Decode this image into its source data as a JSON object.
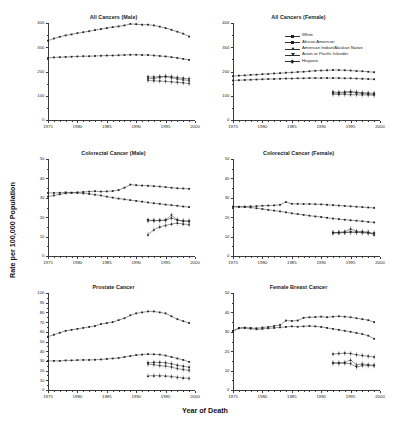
{
  "figure": {
    "xlabel": "Year of Death",
    "ylabel": "Rate per 100,000 Population",
    "x_ticks": [
      "1975",
      "1980",
      "1985",
      "1990",
      "1995",
      "2000"
    ],
    "x_range": [
      1975,
      2000
    ]
  },
  "legend": {
    "position": "top-right-of-panel-2",
    "entries": [
      {
        "label": "White",
        "marker": "square"
      },
      {
        "label": "African American",
        "marker": "square"
      },
      {
        "label": "American Indian/Alaskan Native",
        "marker": "triangle-up"
      },
      {
        "label": "Asian or Pacific Islander",
        "marker": "triangle-down"
      },
      {
        "label": "Hispanic",
        "marker": "diamond"
      }
    ]
  },
  "chart_data": [
    {
      "type": "line",
      "title": "All Cancers (Male)",
      "xlabel": "Year of Death",
      "ylabel": "Rate per 100,000 Population",
      "ylim": [
        0,
        400
      ],
      "y_ticks": [
        0,
        100,
        200,
        300,
        400
      ],
      "xlim": [
        1975,
        2000
      ],
      "x": [
        1975,
        1976,
        1977,
        1978,
        1979,
        1980,
        1981,
        1982,
        1983,
        1984,
        1985,
        1986,
        1987,
        1988,
        1989,
        1990,
        1991,
        1992,
        1993,
        1994,
        1995,
        1996,
        1997,
        1998,
        1999
      ],
      "series": [
        {
          "name": "African American",
          "marker": "square",
          "values": [
            327,
            336,
            343,
            349,
            353,
            358,
            362,
            366,
            371,
            375,
            379,
            383,
            386,
            390,
            396,
            395,
            393,
            393,
            390,
            385,
            379,
            372,
            364,
            356,
            344
          ]
        },
        {
          "name": "White",
          "marker": "square",
          "values": [
            256,
            258,
            259,
            260,
            261,
            262,
            263,
            263,
            264,
            265,
            266,
            266,
            267,
            268,
            269,
            269,
            268,
            268,
            266,
            264,
            262,
            259,
            256,
            252,
            248
          ]
        },
        {
          "name": "American Indian/Alaskan Native",
          "marker": "triangle-up",
          "x": [
            1992,
            1993,
            1994,
            1995,
            1996,
            1997,
            1998,
            1999
          ],
          "values": [
            172,
            171,
            176,
            179,
            175,
            170,
            166,
            163
          ]
        },
        {
          "name": "Asian or Pacific Islander",
          "marker": "triangle-down",
          "x": [
            1992,
            1993,
            1994,
            1995,
            1996,
            1997,
            1998,
            1999
          ],
          "values": [
            163,
            161,
            160,
            159,
            157,
            155,
            153,
            150
          ]
        },
        {
          "name": "Hispanic",
          "marker": "diamond",
          "x": [
            1992,
            1993,
            1994,
            1995,
            1996,
            1997,
            1998,
            1999
          ],
          "values": [
            178,
            177,
            179,
            180,
            178,
            175,
            172,
            170
          ]
        }
      ]
    },
    {
      "type": "line",
      "title": "All Cancers (Female)",
      "ylim": [
        0,
        400
      ],
      "y_ticks": [
        0,
        100,
        200,
        300,
        400
      ],
      "xlim": [
        1975,
        2000
      ],
      "x": [
        1975,
        1976,
        1977,
        1978,
        1979,
        1980,
        1981,
        1982,
        1983,
        1984,
        1985,
        1986,
        1987,
        1988,
        1989,
        1990,
        1991,
        1992,
        1993,
        1994,
        1995,
        1996,
        1997,
        1998,
        1999
      ],
      "series": [
        {
          "name": "African American",
          "marker": "square",
          "values": [
            181,
            183,
            184,
            186,
            187,
            189,
            190,
            192,
            193,
            195,
            196,
            198,
            199,
            201,
            203,
            204,
            205,
            206,
            206,
            205,
            204,
            202,
            201,
            199,
            197
          ]
        },
        {
          "name": "White",
          "marker": "square",
          "values": [
            163,
            164,
            165,
            166,
            167,
            168,
            169,
            169,
            170,
            171,
            171,
            172,
            172,
            173,
            173,
            173,
            173,
            173,
            173,
            172,
            172,
            171,
            170,
            169,
            168
          ]
        },
        {
          "name": "American Indian/Alaskan Native",
          "marker": "triangle-up",
          "x": [
            1992,
            1993,
            1994,
            1995,
            1996,
            1997,
            1998,
            1999
          ],
          "values": [
            112,
            110,
            113,
            117,
            113,
            110,
            108,
            106
          ]
        },
        {
          "name": "Asian or Pacific Islander",
          "marker": "triangle-down",
          "x": [
            1992,
            1993,
            1994,
            1995,
            1996,
            1997,
            1998,
            1999
          ],
          "values": [
            106,
            105,
            105,
            104,
            104,
            103,
            103,
            102
          ]
        },
        {
          "name": "Hispanic",
          "marker": "diamond",
          "x": [
            1992,
            1993,
            1994,
            1995,
            1996,
            1997,
            1998,
            1999
          ],
          "values": [
            115,
            114,
            115,
            116,
            114,
            112,
            111,
            110
          ]
        }
      ]
    },
    {
      "type": "line",
      "title": "Colorectal Cancer (Male)",
      "ylim": [
        0,
        50
      ],
      "y_ticks": [
        0,
        10,
        20,
        30,
        40,
        50
      ],
      "xlim": [
        1975,
        2000
      ],
      "x": [
        1975,
        1976,
        1977,
        1978,
        1979,
        1980,
        1981,
        1982,
        1983,
        1984,
        1985,
        1986,
        1987,
        1988,
        1989,
        1990,
        1991,
        1992,
        1993,
        1994,
        1995,
        1996,
        1997,
        1998,
        1999
      ],
      "series": [
        {
          "name": "African American",
          "marker": "square",
          "values": [
            32.5,
            32.5,
            32.6,
            32.8,
            32.6,
            32.8,
            33.0,
            33.2,
            33.4,
            33.2,
            33.3,
            33.5,
            34.0,
            35.2,
            36.8,
            36.5,
            36.3,
            36.2,
            36.0,
            35.8,
            35.5,
            35.2,
            34.9,
            34.8,
            34.6
          ]
        },
        {
          "name": "White",
          "marker": "square",
          "values": [
            30.6,
            31.2,
            31.8,
            32.3,
            32.6,
            32.5,
            32.3,
            32.0,
            31.6,
            31.2,
            30.6,
            30.1,
            29.6,
            29.2,
            28.8,
            28.4,
            28.0,
            27.6,
            27.2,
            26.9,
            26.5,
            26.2,
            25.9,
            25.5,
            25.2
          ]
        },
        {
          "name": "American Indian/Alaskan Native",
          "marker": "triangle-up",
          "x": [
            1992,
            1993,
            1994,
            1995,
            1996,
            1997,
            1998,
            1999
          ],
          "values": [
            11.0,
            13.5,
            15.0,
            15.8,
            16.5,
            17.0,
            16.5,
            16.2
          ]
        },
        {
          "name": "Asian or Pacific Islander",
          "marker": "triangle-down",
          "x": [
            1992,
            1993,
            1994,
            1995,
            1996,
            1997,
            1998,
            1999
          ],
          "values": [
            18.5,
            18.3,
            18.3,
            18.5,
            21.0,
            18.6,
            18.0,
            17.8
          ]
        },
        {
          "name": "Hispanic",
          "marker": "diamond",
          "x": [
            1992,
            1993,
            1994,
            1995,
            1996,
            1997,
            1998,
            1999
          ],
          "values": [
            18.2,
            18.2,
            18.3,
            18.4,
            19.5,
            18.4,
            18.1,
            18.0
          ]
        }
      ]
    },
    {
      "type": "line",
      "title": "Colorectal Cancer (Female)",
      "ylim": [
        0,
        50
      ],
      "y_ticks": [
        0,
        10,
        20,
        30,
        40,
        50
      ],
      "xlim": [
        1975,
        2000
      ],
      "x": [
        1975,
        1976,
        1977,
        1978,
        1979,
        1980,
        1981,
        1982,
        1983,
        1984,
        1985,
        1986,
        1987,
        1988,
        1989,
        1990,
        1991,
        1992,
        1993,
        1994,
        1995,
        1996,
        1997,
        1998,
        1999
      ],
      "series": [
        {
          "name": "African American",
          "marker": "square",
          "values": [
            25.4,
            25.4,
            25.5,
            25.6,
            25.7,
            25.9,
            26.0,
            26.1,
            26.4,
            27.8,
            26.9,
            26.9,
            26.8,
            26.8,
            26.7,
            26.6,
            26.4,
            26.2,
            26.0,
            25.8,
            25.6,
            25.4,
            25.2,
            25.0,
            24.8
          ]
        },
        {
          "name": "White",
          "marker": "square",
          "values": [
            25.4,
            25.3,
            25.2,
            25.0,
            24.6,
            24.2,
            23.8,
            23.4,
            23.0,
            22.5,
            22.0,
            21.6,
            21.2,
            20.8,
            20.4,
            20.1,
            19.7,
            19.3,
            19.0,
            18.7,
            18.4,
            18.2,
            17.9,
            17.6,
            17.3
          ]
        },
        {
          "name": "American Indian/Alaskan Native",
          "marker": "triangle-up",
          "x": [
            1992,
            1993,
            1994,
            1995,
            1996,
            1997,
            1998,
            1999
          ],
          "values": [
            12.0,
            12.2,
            12.5,
            14.0,
            12.8,
            12.6,
            12.3,
            10.9
          ]
        },
        {
          "name": "Asian or Pacific Islander",
          "marker": "triangle-down",
          "x": [
            1992,
            1993,
            1994,
            1995,
            1996,
            1997,
            1998,
            1999
          ],
          "values": [
            11.8,
            11.9,
            12.0,
            12.2,
            12.1,
            12.0,
            11.8,
            11.5
          ]
        },
        {
          "name": "Hispanic",
          "marker": "diamond",
          "x": [
            1992,
            1993,
            1994,
            1995,
            1996,
            1997,
            1998,
            1999
          ],
          "values": [
            12.1,
            12.1,
            12.2,
            12.4,
            12.3,
            12.2,
            12.0,
            11.8
          ]
        }
      ]
    },
    {
      "type": "line",
      "title": "Prostate Cancer",
      "ylim": [
        0,
        100
      ],
      "y_ticks": [
        0,
        10,
        20,
        30,
        40,
        50,
        60,
        70,
        80,
        90,
        100
      ],
      "xlim": [
        1975,
        2000
      ],
      "x": [
        1975,
        1976,
        1977,
        1978,
        1979,
        1980,
        1981,
        1982,
        1983,
        1984,
        1985,
        1986,
        1987,
        1988,
        1989,
        1990,
        1991,
        1992,
        1993,
        1994,
        1995,
        1996,
        1997,
        1998,
        1999
      ],
      "series": [
        {
          "name": "African American",
          "marker": "square",
          "values": [
            55,
            57,
            59,
            61,
            62,
            63,
            64,
            65,
            66,
            68,
            69,
            70,
            72,
            74,
            77,
            79,
            80,
            81,
            81,
            80,
            79,
            76,
            73,
            71,
            69
          ]
        },
        {
          "name": "White",
          "marker": "square",
          "values": [
            30,
            30,
            30,
            30.5,
            30.5,
            30.8,
            31,
            31,
            31.2,
            31.5,
            32,
            32.5,
            33,
            34,
            35,
            36,
            36.5,
            37,
            36.8,
            36.5,
            35.5,
            34,
            32.5,
            31,
            29
          ]
        },
        {
          "name": "American Indian/Alaskan Native",
          "marker": "triangle-up",
          "x": [
            1992,
            1993,
            1994,
            1995,
            1996,
            1997,
            1998,
            1999
          ],
          "values": [
            14.5,
            14.8,
            14.8,
            14.5,
            14.0,
            13.2,
            12.5,
            12.0
          ]
        },
        {
          "name": "Asian or Pacific Islander",
          "marker": "triangle-down",
          "x": [
            1992,
            1993,
            1994,
            1995,
            1996,
            1997,
            1998,
            1999
          ],
          "values": [
            26.5,
            26.0,
            25.0,
            24.5,
            23.5,
            22.0,
            21.0,
            20.0
          ]
        },
        {
          "name": "Hispanic",
          "marker": "diamond",
          "x": [
            1992,
            1993,
            1994,
            1995,
            1996,
            1997,
            1998,
            1999
          ],
          "values": [
            28.0,
            28.5,
            28.5,
            28.0,
            27.0,
            25.5,
            24.5,
            23.5
          ]
        }
      ]
    },
    {
      "type": "line",
      "title": "Female Breast Cancer",
      "ylim": [
        0,
        50
      ],
      "y_ticks": [
        0,
        10,
        20,
        30,
        40,
        50
      ],
      "xlim": [
        1975,
        2000
      ],
      "x": [
        1975,
        1976,
        1977,
        1978,
        1979,
        1980,
        1981,
        1982,
        1983,
        1984,
        1985,
        1986,
        1987,
        1988,
        1989,
        1990,
        1991,
        1992,
        1993,
        1994,
        1995,
        1996,
        1997,
        1998,
        1999
      ],
      "series": [
        {
          "name": "African American",
          "marker": "square",
          "values": [
            30.5,
            32.0,
            32.2,
            32.0,
            31.8,
            32.2,
            32.5,
            33.0,
            33.5,
            35.8,
            35.6,
            35.8,
            37.2,
            37.5,
            37.6,
            37.8,
            37.5,
            37.8,
            38.0,
            37.8,
            37.5,
            37.0,
            36.5,
            36.0,
            35.0
          ]
        },
        {
          "name": "White",
          "marker": "square",
          "values": [
            30.2,
            31.8,
            31.9,
            31.6,
            31.3,
            31.5,
            31.8,
            32.0,
            32.3,
            32.5,
            32.8,
            32.6,
            32.8,
            33.0,
            32.8,
            32.5,
            32.0,
            31.5,
            31.0,
            30.5,
            30.0,
            29.4,
            28.8,
            28.0,
            26.4
          ]
        },
        {
          "name": "American Indian/Alaskan Native",
          "marker": "triangle-up",
          "x": [
            1992,
            1993,
            1994,
            1995,
            1996,
            1997,
            1998,
            1999
          ],
          "values": [
            14.0,
            14.0,
            14.2,
            15.5,
            13.0,
            13.5,
            13.0,
            12.8
          ]
        },
        {
          "name": "Asian or Pacific Islander",
          "marker": "triangle-down",
          "x": [
            1992,
            1993,
            1994,
            1995,
            1996,
            1997,
            1998,
            1999
          ],
          "values": [
            13.8,
            13.7,
            13.8,
            13.5,
            11.8,
            12.5,
            12.6,
            12.5
          ]
        },
        {
          "name": "Hispanic",
          "marker": "diamond",
          "x": [
            1992,
            1993,
            1994,
            1995,
            1996,
            1997,
            1998,
            1999
          ],
          "values": [
            18.5,
            18.8,
            19.0,
            18.8,
            18.2,
            17.8,
            17.4,
            17.0
          ]
        }
      ]
    }
  ]
}
